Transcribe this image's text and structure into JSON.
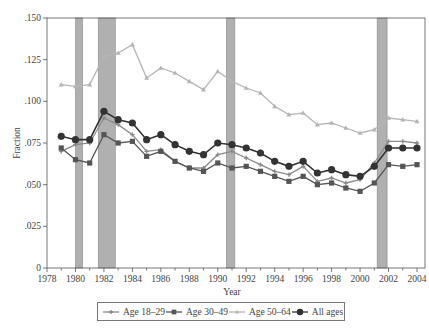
{
  "chart_data": {
    "type": "line",
    "title": "",
    "xlabel": "Year",
    "ylabel": "Fraction",
    "xlim": [
      1978,
      2005
    ],
    "ylim": [
      0,
      0.15
    ],
    "grid": false,
    "legend_position": "bottom",
    "x_ticks": [
      "1978",
      "1980",
      "1982",
      "1984",
      "1986",
      "1988",
      "1990",
      "1992",
      "1994",
      "1996",
      "1998",
      "2000",
      "2002",
      "2004"
    ],
    "y_ticks": [
      "0",
      ".025",
      ".050",
      ".075",
      ".100",
      ".125",
      ".150"
    ],
    "recession_bands": [
      [
        1980.0,
        1980.5
      ],
      [
        1981.6,
        1982.8
      ],
      [
        1990.6,
        1991.2
      ],
      [
        2001.2,
        2001.9
      ]
    ],
    "x": [
      1979,
      1980,
      1981,
      1982,
      1983,
      1984,
      1985,
      1986,
      1987,
      1988,
      1989,
      1990,
      1991,
      1992,
      1993,
      1994,
      1995,
      1996,
      1997,
      1998,
      1999,
      2000,
      2001,
      2002,
      2003,
      2004
    ],
    "series": [
      {
        "name": "Age 18–29",
        "marker": "plus",
        "color": "#8a8a8a",
        "values": [
          0.07,
          0.074,
          0.075,
          0.09,
          0.086,
          0.08,
          0.07,
          0.071,
          0.064,
          0.06,
          0.06,
          0.068,
          0.07,
          0.066,
          0.062,
          0.058,
          0.056,
          0.061,
          0.052,
          0.054,
          0.051,
          0.053,
          0.063,
          0.076,
          0.076,
          0.075
        ]
      },
      {
        "name": "Age 30–49",
        "marker": "square",
        "color": "#555555",
        "values": [
          0.072,
          0.065,
          0.063,
          0.08,
          0.075,
          0.076,
          0.067,
          0.07,
          0.064,
          0.06,
          0.058,
          0.063,
          0.06,
          0.061,
          0.058,
          0.055,
          0.052,
          0.055,
          0.05,
          0.051,
          0.048,
          0.046,
          0.051,
          0.062,
          0.061,
          0.062
        ]
      },
      {
        "name": "Age 50–64",
        "marker": "triangle",
        "color": "#b5b5b5",
        "values": [
          0.11,
          0.109,
          0.11,
          0.127,
          0.129,
          0.134,
          0.114,
          0.12,
          0.117,
          0.112,
          0.107,
          0.118,
          0.112,
          0.108,
          0.105,
          0.097,
          0.092,
          0.093,
          0.086,
          0.087,
          0.084,
          0.081,
          0.083,
          0.09,
          0.089,
          0.088
        ]
      },
      {
        "name": "All ages",
        "marker": "circle",
        "color": "#333333",
        "values": [
          0.079,
          0.077,
          0.077,
          0.094,
          0.089,
          0.087,
          0.077,
          0.08,
          0.074,
          0.07,
          0.068,
          0.075,
          0.074,
          0.072,
          0.069,
          0.064,
          0.061,
          0.064,
          0.057,
          0.059,
          0.056,
          0.055,
          0.061,
          0.072,
          0.072,
          0.072
        ]
      }
    ]
  },
  "colors": {
    "recession_band": "#b0b0b0",
    "axis": "#555555"
  }
}
